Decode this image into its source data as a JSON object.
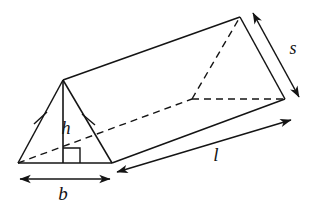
{
  "figure": {
    "shape": "triangular-prism",
    "stroke_color": "#141414",
    "fill_color": "#ffffff",
    "background_color": "#ffffff"
  },
  "labels": {
    "height": "h",
    "base": "b",
    "length": "l",
    "slant": "s"
  },
  "annotations": {
    "right_angle": "right-angle-marker",
    "congruent_tick_left": "tick-mark",
    "congruent_tick_right": "tick-mark"
  },
  "geometry": {
    "front_apex": [
      63,
      80
    ],
    "front_left_base": [
      18,
      163
    ],
    "front_right_base": [
      112,
      163
    ],
    "back_apex": [
      240,
      17
    ],
    "back_left_base": [
      192,
      99
    ],
    "back_right_base": [
      285,
      99
    ],
    "height_foot": [
      63,
      163
    ]
  },
  "measures": {
    "b_arrow_from": [
      18,
      179
    ],
    "b_arrow_to": [
      112,
      179
    ],
    "l_arrow_from": [
      117,
      172
    ],
    "l_arrow_to": [
      291,
      120
    ],
    "s_arrow_from": [
      253,
      13
    ],
    "s_arrow_to": [
      299,
      97
    ]
  }
}
